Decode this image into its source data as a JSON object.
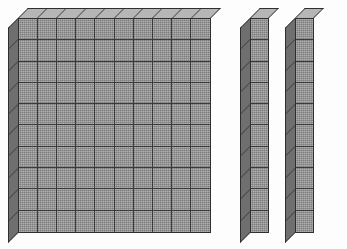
{
  "scene": {
    "title": "Base ten blocks",
    "description": "One hundreds flat and two tens rods",
    "background_color": "#fdfdfd",
    "total_value": "120"
  },
  "style": {
    "front_face_color": "#9a9a9a",
    "top_face_color": "#b6b6b6",
    "left_face_color": "#6f6f6f",
    "outline_color": "#2f2f2f",
    "gridline_color": "#3a3a3a",
    "depth_px": "10"
  },
  "pieces": [
    {
      "id": "hundreds-flat",
      "name": "hundreds-flat",
      "label": "Hundreds flat",
      "value": "100",
      "columns": 10,
      "rows": 10,
      "unit_count": "100",
      "x": 18,
      "y": 18,
      "width": 193,
      "height": 215
    },
    {
      "id": "tens-rod-1",
      "name": "tens-rod-1",
      "label": "Tens rod",
      "value": "10",
      "columns": 1,
      "rows": 10,
      "unit_count": "10",
      "x": 250,
      "y": 18,
      "width": 19,
      "height": 215
    },
    {
      "id": "tens-rod-2",
      "name": "tens-rod-2",
      "label": "Tens rod",
      "value": "10",
      "columns": 1,
      "rows": 10,
      "unit_count": "10",
      "x": 295,
      "y": 18,
      "width": 19,
      "height": 215
    }
  ]
}
